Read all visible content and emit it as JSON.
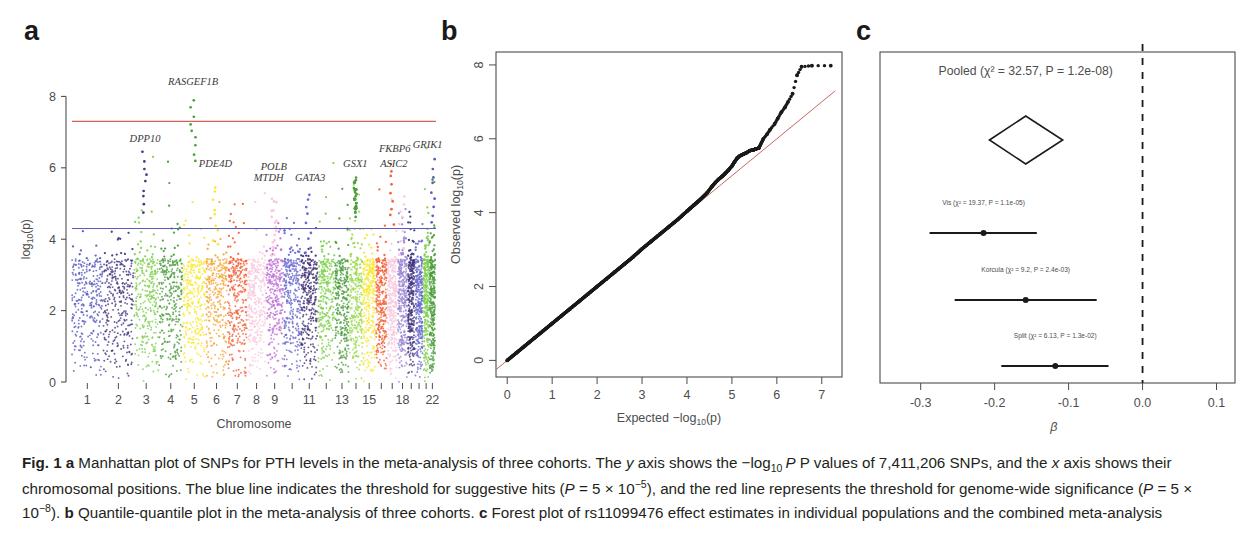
{
  "figure": {
    "id": "Fig. 1",
    "panels": [
      {
        "letter": "a"
      },
      {
        "letter": "b"
      },
      {
        "letter": "c"
      }
    ]
  },
  "caption": {
    "label": "Fig. 1",
    "text_a_1": " Manhattan plot of SNPs for PTH levels in the meta-analysis of three cohorts. The ",
    "text_a_2": " axis shows the −log",
    "text_a_3": " P values of 7,411,206 SNPs, and the ",
    "text_a_4": " axis shows their chromosomal positions. The blue line indicates the threshold for suggestive hits (",
    "text_a_5": " = 5 × 10",
    "text_a_6": "), and the red line represents the threshold for genome-wide significance (",
    "text_a_7": " = 5 × 10",
    "text_a_8": "). ",
    "text_b": " Quantile-quantile plot in the meta-analysis of three cohorts. ",
    "text_c": " Forest plot of rs11099476 effect estimates in individual populations and the combined meta-analysis",
    "letter_a": "a",
    "letter_b": "b",
    "letter_c": "c",
    "italic_y": "y",
    "italic_x": "x",
    "italic_P": "P",
    "sub_10": "10",
    "sup_minus5": "−5",
    "sup_minus8": "−8"
  },
  "chart_data": [
    {
      "type": "scatter",
      "name": "manhattan-plot",
      "panel": "a",
      "title": "",
      "xlabel": "Chromosome",
      "ylabel": "log10(p)",
      "ylim": [
        0,
        8.6
      ],
      "yticks": [
        0,
        2,
        4,
        6,
        8
      ],
      "ytick_labels": [
        "0",
        "2",
        "4",
        "6",
        "8"
      ],
      "xtick_labels": [
        "1",
        "2",
        "3",
        "4",
        "5",
        "6",
        "7",
        "8",
        "9",
        "",
        "11",
        "",
        "13",
        "",
        "15",
        "",
        "",
        "18",
        "",
        "",
        "",
        "22"
      ],
      "chromosomes": [
        {
          "label": "1",
          "width": 249,
          "color": "#5b5bbf"
        },
        {
          "label": "2",
          "width": 243,
          "color": "#46367f"
        },
        {
          "label": "3",
          "width": 198,
          "color": "#7fd14f"
        },
        {
          "label": "4",
          "width": 191,
          "color": "#4c9e3f"
        },
        {
          "label": "5",
          "width": 181,
          "color": "#f7e830"
        },
        {
          "label": "6",
          "width": 171,
          "color": "#f6a83a"
        },
        {
          "label": "7",
          "width": 159,
          "color": "#f4613a"
        },
        {
          "label": "8",
          "width": 146,
          "color": "#f9c8de"
        },
        {
          "label": "9",
          "width": 141,
          "color": "#c173d6"
        },
        {
          "label": "10",
          "width": 136,
          "color": "#6a6ad0"
        },
        {
          "label": "11",
          "width": 135,
          "color": "#3f3176"
        },
        {
          "label": "12",
          "width": 134,
          "color": "#7fd14f"
        },
        {
          "label": "13",
          "width": 115,
          "color": "#4c9e3f"
        },
        {
          "label": "14",
          "width": 107,
          "color": "#9ddb55"
        },
        {
          "label": "15",
          "width": 102,
          "color": "#f7e830"
        },
        {
          "label": "16",
          "width": 90,
          "color": "#f4613a"
        },
        {
          "label": "17",
          "width": 83,
          "color": "#f9c8de"
        },
        {
          "label": "18",
          "width": 80,
          "color": "#9a86d6"
        },
        {
          "label": "19",
          "width": 59,
          "color": "#46367f"
        },
        {
          "label": "20",
          "width": 64,
          "color": "#6a6ad0"
        },
        {
          "label": "21",
          "width": 48,
          "color": "#7fd14f"
        },
        {
          "label": "22",
          "width": 51,
          "color": "#4c9e3f"
        }
      ],
      "threshold_lines": [
        {
          "name": "genome-wide-significance",
          "y": 7.3,
          "color": "#d4605a"
        },
        {
          "name": "suggestive",
          "y": 4.3,
          "color": "#5b5bbf"
        }
      ],
      "gene_annotations": [
        {
          "gene": "GRIK1",
          "chrom": 21,
          "y": 6.55,
          "peak": 6.25,
          "color": "#5b5bbf"
        },
        {
          "gene": "DPP10",
          "chrom": 2,
          "y": 6.72,
          "peak": 6.5,
          "color": "#46367f"
        },
        {
          "gene": "RASGEF1B",
          "chrom": 4,
          "y": 8.32,
          "peak": 7.95,
          "color": "#4c9e3f"
        },
        {
          "gene": "PDE4D",
          "chrom": 5,
          "y": 6.02,
          "peak": 5.55,
          "color": "#f7e830"
        },
        {
          "gene": "POLB",
          "chrom": 8,
          "y": 5.95,
          "peak": 5.25,
          "color": "#f9c8de"
        },
        {
          "gene": "MTDH",
          "chrom": 8,
          "y": 5.62,
          "peak": 5.1,
          "color": "#f9c8de"
        },
        {
          "gene": "GATA3",
          "chrom": 10,
          "y": 5.62,
          "peak": 5.35,
          "color": "#6a6ad0"
        },
        {
          "gene": "GSX1",
          "chrom": 13,
          "y": 6.02,
          "peak": 5.75,
          "color": "#4c9e3f"
        },
        {
          "gene": "ASIC2",
          "chrom": 17,
          "y": 6.02,
          "peak": 5.3,
          "color": "#f9c8de"
        },
        {
          "gene": "FKBP6",
          "chrom": 16,
          "y": 6.45,
          "peak": 6.22,
          "color": "#f4613a"
        }
      ]
    },
    {
      "type": "scatter",
      "name": "qq-plot",
      "panel": "b",
      "title": "",
      "xlabel": "Expected −log10(p)",
      "ylabel": "Observed  log10(p)",
      "xlim": [
        -0.25,
        7.45
      ],
      "ylim": [
        -0.45,
        8.35
      ],
      "xticks": [
        0,
        1,
        2,
        3,
        4,
        5,
        6,
        7
      ],
      "xtick_labels": [
        "0",
        "1",
        "2",
        "3",
        "4",
        "5",
        "6",
        "7"
      ],
      "yticks": [
        0,
        2,
        4,
        6,
        8
      ],
      "ytick_labels": [
        "0",
        "2",
        "4",
        "6",
        "8"
      ],
      "reference_line": {
        "name": "identity-line",
        "color": "#c0564f",
        "from": [
          -0.25,
          -0.25
        ],
        "to": [
          7.3,
          7.3
        ]
      },
      "points": [
        [
          0.0,
          0.0
        ],
        [
          0.2,
          0.2
        ],
        [
          0.4,
          0.4
        ],
        [
          0.6,
          0.6
        ],
        [
          0.8,
          0.8
        ],
        [
          1.0,
          1.0
        ],
        [
          1.2,
          1.2
        ],
        [
          1.4,
          1.4
        ],
        [
          1.6,
          1.6
        ],
        [
          1.8,
          1.8
        ],
        [
          2.0,
          2.0
        ],
        [
          2.2,
          2.2
        ],
        [
          2.4,
          2.4
        ],
        [
          2.6,
          2.6
        ],
        [
          2.8,
          2.8
        ],
        [
          3.0,
          3.02
        ],
        [
          3.2,
          3.22
        ],
        [
          3.4,
          3.42
        ],
        [
          3.6,
          3.62
        ],
        [
          3.8,
          3.82
        ],
        [
          4.0,
          4.04
        ],
        [
          4.15,
          4.2
        ],
        [
          4.3,
          4.36
        ],
        [
          4.45,
          4.54
        ],
        [
          4.55,
          4.7
        ],
        [
          4.62,
          4.8
        ],
        [
          4.7,
          4.9
        ],
        [
          4.78,
          4.98
        ],
        [
          4.85,
          5.06
        ],
        [
          4.92,
          5.15
        ],
        [
          5.0,
          5.26
        ],
        [
          5.06,
          5.38
        ],
        [
          5.12,
          5.48
        ],
        [
          5.18,
          5.54
        ],
        [
          5.25,
          5.58
        ],
        [
          5.32,
          5.62
        ],
        [
          5.4,
          5.68
        ],
        [
          5.48,
          5.7
        ],
        [
          5.52,
          5.72
        ],
        [
          5.6,
          5.75
        ],
        [
          5.7,
          6.0
        ],
        [
          5.78,
          6.12
        ],
        [
          5.85,
          6.25
        ],
        [
          5.95,
          6.4
        ],
        [
          6.02,
          6.55
        ],
        [
          6.1,
          6.72
        ],
        [
          6.18,
          6.85
        ],
        [
          6.25,
          7.0
        ],
        [
          6.35,
          7.22
        ],
        [
          6.45,
          7.72
        ],
        [
          6.55,
          7.95
        ],
        [
          6.78,
          7.98
        ],
        [
          7.2,
          7.98
        ]
      ]
    },
    {
      "type": "forest",
      "name": "forest-plot",
      "panel": "c",
      "title": "",
      "xlabel": "β",
      "xlim": [
        -0.355,
        0.125
      ],
      "xticks": [
        -0.3,
        -0.2,
        -0.1,
        0.0,
        0.1
      ],
      "xtick_labels": [
        "-0.3",
        "-0.2",
        "-0.1",
        "0.0",
        "0.1"
      ],
      "null_line": {
        "name": "null-effect-line",
        "x": 0.0,
        "style": "dashed"
      },
      "pooled": {
        "label": "Pooled (χ² = 32.57, P = 1.2e-08)",
        "estimate": -0.158,
        "lower": -0.207,
        "upper": -0.108
      },
      "studies": [
        {
          "label": "Vis (χ² = 19.37, P = 1.1e-05)",
          "estimate": -0.215,
          "lower": -0.288,
          "upper": -0.143
        },
        {
          "label": "Korcula (χ² = 9.2, P = 2.4e-03)",
          "estimate": -0.158,
          "lower": -0.254,
          "upper": -0.062
        },
        {
          "label": "Split (χ² = 6.13, P = 1.3e-02)",
          "estimate": -0.118,
          "lower": -0.191,
          "upper": -0.046
        }
      ]
    }
  ],
  "colors": {
    "significance_red": "#d4605a",
    "suggestive_blue": "#5b5bbf",
    "axis_gray": "#4d4d4d",
    "point_black": "#1a1a1a"
  }
}
